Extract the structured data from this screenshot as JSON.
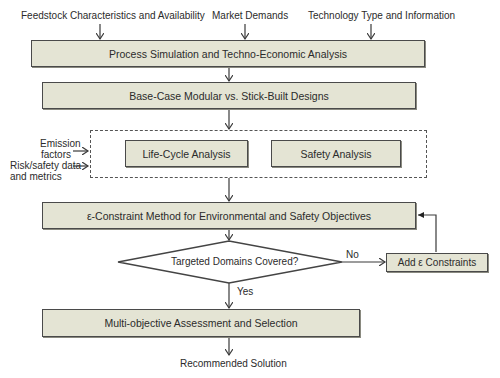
{
  "inputs": {
    "feedstock": "Feedstock Characteristics and Availability",
    "market": "Market Demands",
    "technology": "Technology Type and Information"
  },
  "steps": {
    "process_sim": "Process Simulation and Techno-Economic Analysis",
    "base_case": "Base-Case Modular vs. Stick-Built Designs",
    "lca": "Life-Cycle Analysis",
    "safety": "Safety Analysis",
    "epsilon_method": "ε-Constraint Method for Environmental and Safety Objectives",
    "decision": "Targeted Domains Covered?",
    "add_constraints": "Add ε Constraints",
    "multi_objective": "Multi-objective Assessment and Selection",
    "output": "Recommended Solution"
  },
  "side_inputs": {
    "emission_line1": "Emission",
    "emission_line2": "factors",
    "risk_line1": "Risk/safety data",
    "risk_line2": "and metrics"
  },
  "branches": {
    "no": "No",
    "yes": "Yes"
  },
  "colors": {
    "box_fill": "#e4e4d4",
    "box_border": "#4a4a4a",
    "line": "#3a3a3a"
  }
}
